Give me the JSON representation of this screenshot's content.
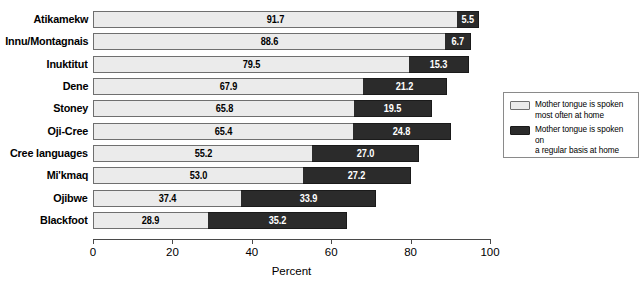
{
  "chart_data": {
    "type": "bar",
    "orientation": "horizontal",
    "stacked": true,
    "title": "",
    "xlabel": "Percent",
    "ylabel": "",
    "xlim": [
      0,
      100
    ],
    "xticks": [
      0,
      20,
      40,
      60,
      80,
      100
    ],
    "xtick_labels": [
      "0",
      "20",
      "40",
      "60",
      "80",
      "100"
    ],
    "grid": false,
    "legend_position": "right",
    "categories": [
      "Atikamekw",
      "Innu/Montagnais",
      "Inuktitut",
      "Dene",
      "Stoney",
      "Oji-Cree",
      "Cree languages",
      "Mi'kmaq",
      "Ojibwe",
      "Blackfoot"
    ],
    "series": [
      {
        "name": "Mother tongue is spoken most often at home",
        "color": "#ebebeb",
        "values": [
          91.7,
          88.6,
          79.5,
          67.9,
          65.8,
          65.4,
          55.2,
          53.0,
          37.4,
          28.9
        ],
        "labels": [
          "91.7",
          "88.6",
          "79.5",
          "67.9",
          "65.8",
          "65.4",
          "55.2",
          "53.0",
          "37.4",
          "28.9"
        ]
      },
      {
        "name": "Mother tongue is spoken on a regular basis at home",
        "color": "#2b2b2b",
        "values": [
          5.5,
          6.7,
          15.3,
          21.2,
          19.5,
          24.8,
          27.0,
          27.2,
          33.9,
          35.2
        ],
        "labels": [
          "5.5",
          "6.7",
          "15.3",
          "21.2",
          "19.5",
          "24.8",
          "27.0",
          "27.2",
          "33.9",
          "35.2"
        ]
      }
    ]
  },
  "legend": {
    "entries": [
      {
        "line1": "Mother tongue is spoken",
        "line2": "most often at home",
        "swatch": "light"
      },
      {
        "line1": "Mother tongue is spoken on",
        "line2": "a regular basis at home",
        "swatch": "dark"
      }
    ]
  },
  "colors": {
    "light_segment": "#ebebeb",
    "dark_segment": "#2b2b2b",
    "axis": "#4a4a4a",
    "background": "#ffffff"
  }
}
